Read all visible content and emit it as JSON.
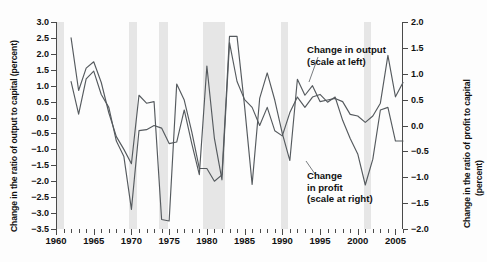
{
  "chart_data": {
    "type": "line",
    "title": "",
    "xlabel": "",
    "ylabel": "Change in the ratio of output to capital (percent)",
    "y2label": "Change in the ratio of profit to capital (percent)",
    "xlim": [
      1960,
      2006
    ],
    "ylim": [
      -3.5,
      3.0
    ],
    "y2lim": [
      -2.0,
      2.0
    ],
    "grid": false,
    "legend_position": "inline-annotations",
    "y_ticks": [
      3.0,
      2.5,
      2.0,
      1.5,
      1.0,
      0.5,
      0.0,
      -0.5,
      -1.0,
      -1.5,
      -2.0,
      -2.5,
      -3.0,
      -3.5
    ],
    "y_tick_labels": [
      "3.0",
      "2.5",
      "2.0",
      "1.5",
      "1.0",
      "0.5",
      "0.0",
      "-0.5",
      "-1.0",
      "-1.5",
      "-2.0",
      "-2.5",
      "-3.0",
      "-3.5"
    ],
    "y2_ticks": [
      2.0,
      1.5,
      1.0,
      0.5,
      0.0,
      -0.5,
      -1.0,
      -1.5,
      -2.0
    ],
    "y2_tick_labels": [
      "2.0",
      "1.5",
      "1.0",
      "0.5",
      "0.0",
      "-0.5",
      "-1.0",
      "-1.5",
      "-2.0"
    ],
    "x_ticks": [
      1960,
      1965,
      1970,
      1975,
      1980,
      1985,
      1990,
      1995,
      2000,
      2005
    ],
    "x_tick_labels": [
      "1960",
      "1965",
      "1970",
      "1975",
      "1980",
      "1985",
      "1990",
      "1995",
      "2000",
      "2005"
    ],
    "x_minor_tick_step": 1,
    "shaded_bands": [
      {
        "start": 1960.0,
        "end": 1961.1
      },
      {
        "start": 1969.7,
        "end": 1970.7
      },
      {
        "start": 1973.7,
        "end": 1974.8
      },
      {
        "start": 1979.5,
        "end": 1982.4
      },
      {
        "start": 1989.8,
        "end": 1990.8
      },
      {
        "start": 2000.8,
        "end": 2001.8
      }
    ],
    "band_color": "#e6e6e6",
    "line_color": "#555a5e",
    "series": [
      {
        "name": "Change in output",
        "axis": "left",
        "annotation": [
          "Change in output",
          "(scale at left)"
        ],
        "x": [
          1962,
          1963,
          1964,
          1965,
          1966,
          1967,
          1968,
          1969,
          1970,
          1971,
          1972,
          1973,
          1974,
          1975,
          1976,
          1977,
          1978,
          1979,
          1980,
          1981,
          1982,
          1983,
          1984,
          1985,
          1986,
          1987,
          1988,
          1989,
          1990,
          1991,
          1992,
          1993,
          1994,
          1995,
          1996,
          1997,
          1998,
          1999,
          2000,
          2001,
          2002,
          2003,
          2004,
          2005,
          2006
        ],
        "values": [
          2.5,
          0.85,
          1.55,
          1.75,
          1.1,
          0.15,
          -0.6,
          -1.0,
          -1.45,
          0.7,
          0.45,
          0.5,
          -3.2,
          -3.25,
          1.05,
          0.55,
          -0.45,
          -1.6,
          -1.6,
          -2.0,
          -1.8,
          2.55,
          2.55,
          0.35,
          -2.1,
          0.6,
          1.4,
          0.55,
          -0.5,
          -1.35,
          1.2,
          0.7,
          1.0,
          0.5,
          0.55,
          0.6,
          0.5,
          0.1,
          0.05,
          -0.15,
          0.05,
          0.45,
          1.95,
          0.65,
          1.1
        ]
      },
      {
        "name": "Change in profit",
        "axis": "right",
        "annotation": [
          "Change",
          "in profit",
          "(scale at right)"
        ],
        "x": [
          1962,
          1963,
          1964,
          1965,
          1966,
          1967,
          1968,
          1969,
          1970,
          1971,
          1972,
          1973,
          1974,
          1975,
          1976,
          1977,
          1978,
          1979,
          1980,
          1981,
          1982,
          1983,
          1984,
          1985,
          1986,
          1987,
          1988,
          1989,
          1990,
          1991,
          1992,
          1993,
          1994,
          1995,
          1996,
          1997,
          1998,
          1999,
          2000,
          2001,
          2002,
          2003,
          2004,
          2005,
          2006
        ],
        "values": [
          0.85,
          0.22,
          0.9,
          1.05,
          0.6,
          0.35,
          -0.3,
          -0.6,
          -1.62,
          -0.1,
          -0.08,
          0.0,
          -0.05,
          -0.35,
          -0.32,
          0.3,
          -0.35,
          -0.95,
          1.15,
          -0.25,
          -1.05,
          1.6,
          0.85,
          0.5,
          0.35,
          0.0,
          0.35,
          -0.1,
          -0.2,
          0.25,
          0.55,
          0.35,
          0.55,
          0.6,
          0.45,
          0.55,
          0.1,
          -0.25,
          -0.55,
          -1.15,
          -0.65,
          0.3,
          0.35,
          -0.3,
          -0.3
        ]
      }
    ]
  }
}
